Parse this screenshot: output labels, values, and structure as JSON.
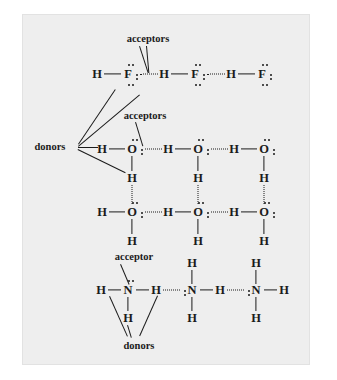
{
  "figure": {
    "background_color": "#eeeeee",
    "ink_color": "#1b1b1b",
    "page_color": "#ffffff"
  },
  "labels": {
    "acceptors_hf": "acceptors",
    "acceptors_water": "acceptors",
    "donors_left": "donors",
    "acceptor_ammonia": "acceptor",
    "donors_bottom": "donors"
  },
  "atoms": {
    "H": "H",
    "F": "F",
    "O": "O",
    "N": "N"
  },
  "rows": {
    "hf": {
      "name": "hydrogen-fluoride-chain",
      "formula": "H-F",
      "units": 3,
      "sequence": [
        "H",
        "F",
        "H",
        "F",
        "H",
        "F"
      ],
      "lone_pairs_per_F": 3,
      "hydrogen_bond_style": "dotted-horizontal"
    },
    "water_top": {
      "name": "water-chain-top",
      "formula": "H2O",
      "units": 4,
      "lone_pairs_per_O": 2,
      "hydrogen_bond_style": "dotted-horizontal"
    },
    "water_bottom": {
      "name": "water-chain-bottom",
      "formula": "H2O",
      "units": 4,
      "lone_pairs_per_O": 2,
      "hydrogen_bond_style": "dotted-horizontal",
      "vertical_hydrogen_bonds": 4
    },
    "ammonia": {
      "name": "ammonia-chain",
      "formula": "NH3",
      "units": 4,
      "lone_pairs_per_N": 1,
      "hydrogen_bond_style": "dotted-horizontal"
    }
  }
}
